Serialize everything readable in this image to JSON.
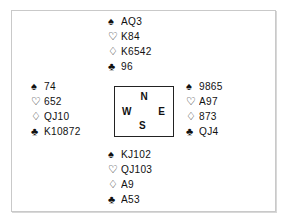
{
  "diagram": {
    "type": "bridge-deal-diagram",
    "suit_order": [
      "spades",
      "hearts",
      "diamonds",
      "clubs"
    ],
    "suit_glyphs": {
      "spades": "♠",
      "hearts": "♡",
      "diamonds": "♢",
      "clubs": "♣"
    },
    "suit_fill": {
      "spades": "filled",
      "hearts": "outline",
      "diamonds": "outline",
      "clubs": "filled"
    },
    "colors": {
      "ink": "#111111",
      "frame": "#c9c9c9",
      "frame_shadow": "#d8d8d8",
      "compass_border": "#222222",
      "background": "#ffffff"
    }
  },
  "compass": {
    "north": "N",
    "west": "W",
    "east": "E",
    "south": "S"
  },
  "hands": {
    "north": {
      "label": "North",
      "spades": "AQ3",
      "hearts": "K84",
      "diamonds": "K6542",
      "clubs": "96"
    },
    "west": {
      "label": "West",
      "spades": "74",
      "hearts": "652",
      "diamonds": "QJ10",
      "clubs": "K10872"
    },
    "east": {
      "label": "East",
      "spades": "9865",
      "hearts": "A97",
      "diamonds": "873",
      "clubs": "QJ4"
    },
    "south": {
      "label": "South",
      "spades": "KJ102",
      "hearts": "QJ103",
      "diamonds": "A9",
      "clubs": "A53"
    }
  }
}
